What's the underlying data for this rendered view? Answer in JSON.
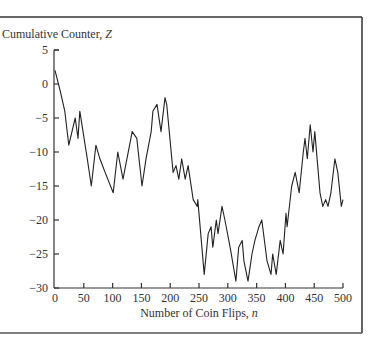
{
  "chart_data": {
    "type": "line",
    "title": "",
    "ylabel": "Cumulative Counter, Z",
    "ylabel_var": "Z",
    "ylabel_prefix": "Cumulative Counter, ",
    "xlabel": "Number of Coin Flips, n",
    "xlabel_var": "n",
    "xlabel_prefix": "Number of Coin Flips, ",
    "xlim": [
      0,
      500
    ],
    "ylim": [
      -30,
      5
    ],
    "x_ticks": [
      0,
      50,
      100,
      150,
      200,
      250,
      300,
      350,
      400,
      450,
      500
    ],
    "y_ticks": [
      5,
      0,
      -5,
      -10,
      -15,
      -20,
      -25,
      -30
    ],
    "x_tick_labels": [
      "0",
      "50",
      "100",
      "150",
      "200",
      "250",
      "300",
      "350",
      "400",
      "450",
      "500"
    ],
    "y_tick_labels": [
      "5",
      "0",
      "−5",
      "−10",
      "−15",
      "−20",
      "−25",
      "−30"
    ],
    "grid": false,
    "legend": null,
    "series": [
      {
        "name": "Z",
        "color": "#222222",
        "x": [
          0,
          9,
          17,
          24,
          35,
          40,
          43,
          56,
          63,
          71,
          78,
          87,
          101,
          109,
          118,
          134,
          142,
          151,
          158,
          167,
          170,
          177,
          184,
          191,
          194,
          205,
          210,
          215,
          220,
          226,
          231,
          240,
          247,
          248,
          259,
          266,
          271,
          274,
          280,
          283,
          290,
          295,
          304,
          314,
          319,
          325,
          328,
          335,
          342,
          347,
          354,
          359,
          368,
          375,
          378,
          384,
          391,
          396,
          401,
          403,
          411,
          417,
          424,
          431,
          434,
          438,
          443,
          448,
          451,
          460,
          465,
          470,
          474,
          479,
          486,
          491,
          497,
          500
        ],
        "y": [
          2,
          -1,
          -4,
          -9,
          -5,
          -8,
          -4,
          -11,
          -15,
          -9,
          -11,
          -13,
          -16,
          -10,
          -14,
          -7,
          -8,
          -15,
          -11,
          -7,
          -4,
          -3,
          -7,
          -2,
          -3,
          -13,
          -12,
          -14,
          -11,
          -14,
          -12,
          -17,
          -18,
          -17,
          -28,
          -22,
          -21,
          -24,
          -20,
          -22,
          -18,
          -20,
          -24,
          -29,
          -24,
          -23,
          -26,
          -29,
          -25,
          -23,
          -21,
          -20,
          -26,
          -28,
          -25,
          -28,
          -23,
          -25,
          -19,
          -21,
          -15,
          -13,
          -16,
          -10,
          -8,
          -11,
          -6,
          -10,
          -7,
          -16,
          -18,
          -17,
          -18,
          -16,
          -11,
          -13,
          -18,
          -17
        ]
      }
    ]
  }
}
